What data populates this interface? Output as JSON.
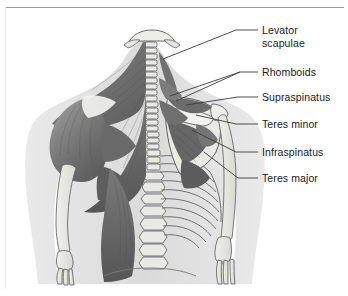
{
  "figure": {
    "view": "posterior",
    "background_color": "#ffffff",
    "border_color": "#9a9a9a",
    "text_color": "#1a1a1a",
    "leader_line_color": "#3a3a3a",
    "palette": {
      "muscle_dark": "#6e6e6e",
      "muscle_mid": "#8a8a8a",
      "muscle_light": "#a6a6a6",
      "bone_light": "#e8e8e6",
      "bone_outline": "#6a6a6a",
      "body_tint": "#d9d9d9",
      "tendon_white": "#f4f4f2"
    },
    "labels": [
      {
        "id": "levator-scapulae",
        "lines": [
          "Levator",
          "scapulae"
        ],
        "text_x": 262,
        "text_y": 24,
        "leader": [
          [
            258,
            30
          ],
          [
            236,
            30
          ],
          [
            163,
            59
          ]
        ]
      },
      {
        "id": "rhomboids",
        "lines": [
          "Rhomboids"
        ],
        "text_x": 262,
        "text_y": 66,
        "leader": [
          [
            258,
            72
          ],
          [
            240,
            72
          ],
          [
            170,
            96
          ]
        ]
      },
      {
        "id": "rhomboids-2",
        "lines": [],
        "text_x": 0,
        "text_y": 0,
        "leader": [
          [
            240,
            72
          ],
          [
            176,
            101
          ]
        ]
      },
      {
        "id": "supraspinatus",
        "lines": [
          "Supraspinatus"
        ],
        "text_x": 262,
        "text_y": 91,
        "leader": [
          [
            258,
            97
          ],
          [
            238,
            97
          ],
          [
            186,
            105
          ]
        ]
      },
      {
        "id": "teres-minor",
        "lines": [
          "Teres minor"
        ],
        "text_x": 262,
        "text_y": 118,
        "leader": [
          [
            258,
            124
          ],
          [
            236,
            124
          ],
          [
            196,
            115
          ]
        ]
      },
      {
        "id": "infraspinatus",
        "lines": [
          "Infraspinatus"
        ],
        "text_x": 262,
        "text_y": 146,
        "leader": [
          [
            258,
            152
          ],
          [
            236,
            152
          ],
          [
            192,
            130
          ]
        ]
      },
      {
        "id": "teres-major",
        "lines": [
          "Teres major"
        ],
        "text_x": 262,
        "text_y": 172,
        "leader": [
          [
            258,
            178
          ],
          [
            238,
            178
          ],
          [
            204,
            152
          ]
        ]
      }
    ],
    "structures": [
      "trapezius",
      "deltoid",
      "latissimus-dorsi",
      "levator-scapulae",
      "rhomboid-major",
      "rhomboid-minor",
      "supraspinatus",
      "infraspinatus",
      "teres-minor",
      "teres-major",
      "scapula",
      "spine-of-scapula",
      "vertebral-column",
      "ribcage",
      "humerus",
      "radius",
      "ulna",
      "hand-bones",
      "skull-base",
      "pelvis"
    ]
  }
}
